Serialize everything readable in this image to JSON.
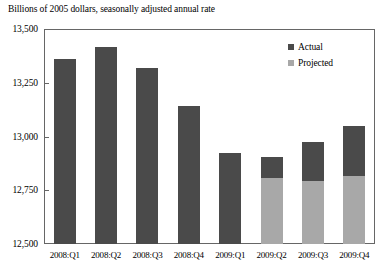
{
  "chart_data": {
    "type": "bar",
    "title": "Billions of 2005 dollars, seasonally adjusted annual rate",
    "xlabel": "",
    "ylabel": "",
    "ylim": [
      12500,
      13500
    ],
    "ytick_labels": [
      "13,500",
      "13,250",
      "13,000",
      "12,750",
      "12,500"
    ],
    "ytick_values": [
      13500,
      13250,
      13000,
      12750,
      12500
    ],
    "grid": false,
    "stacked": true,
    "legend_position": "top-right",
    "categories": [
      "2008:Q1",
      "2008:Q2",
      "2008:Q3",
      "2008:Q4",
      "2009:Q1",
      "2009:Q2",
      "2009:Q3",
      "2009:Q4"
    ],
    "series": [
      {
        "name": "Actual",
        "color": "#4a4a4a",
        "values": [
          13360,
          13415,
          13320,
          13140,
          12925,
          12905,
          12975,
          13050
        ]
      },
      {
        "name": "Projected",
        "color": "#a8a8a8",
        "values": [
          null,
          null,
          null,
          null,
          null,
          12805,
          12795,
          12815
        ]
      }
    ],
    "bars": [
      {
        "category": "2008:Q1",
        "total": 13360,
        "actual_top": 13360,
        "projected_top": null
      },
      {
        "category": "2008:Q2",
        "total": 13415,
        "actual_top": 13415,
        "projected_top": null
      },
      {
        "category": "2008:Q3",
        "total": 13320,
        "actual_top": 13320,
        "projected_top": null
      },
      {
        "category": "2008:Q4",
        "total": 13140,
        "actual_top": 13140,
        "projected_top": null
      },
      {
        "category": "2009:Q1",
        "total": 12925,
        "actual_top": 12925,
        "projected_top": null
      },
      {
        "category": "2009:Q2",
        "total": 12905,
        "actual_top": 12905,
        "projected_top": 12805
      },
      {
        "category": "2009:Q3",
        "total": 12975,
        "actual_top": 12975,
        "projected_top": 12795
      },
      {
        "category": "2009:Q4",
        "total": 13050,
        "actual_top": 13050,
        "projected_top": 12815
      }
    ],
    "legend": [
      {
        "label": "Actual",
        "color": "#4a4a4a"
      },
      {
        "label": "Projected",
        "color": "#a8a8a8"
      }
    ]
  },
  "colors": {
    "actual": "#4a4a4a",
    "projected": "#a8a8a8",
    "axis": "#666666",
    "text": "#000000",
    "background": "#ffffff"
  }
}
